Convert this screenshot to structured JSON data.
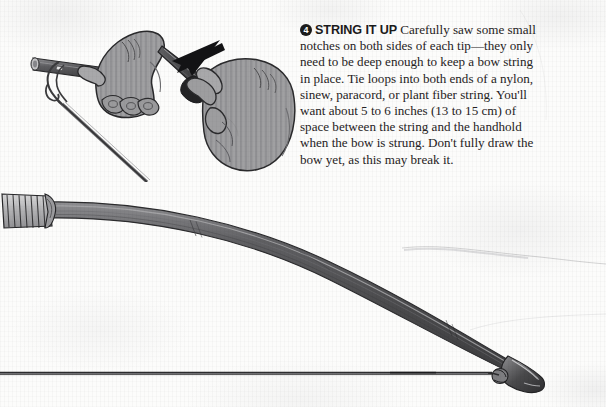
{
  "page": {
    "kind": "scanned-book-page",
    "width": 606,
    "height": 407,
    "background_color": "#fcfcfb"
  },
  "step": {
    "number": "4",
    "heading": "STRING IT UP",
    "body": "Carefully saw some small notches on both sides of each tip—they only need to be deep enough to keep a bow string in place. Tie loops into both ends of a nylon, sinew, paracord, or plant fiber string. You'll want about 5 to 6 inches (13 to 15 cm) of space between the string and the handhold when the bow is strung. Don't fully draw the bow yet, as this may break it."
  },
  "illustrations": {
    "top": {
      "name": "hands-tying-bowstring",
      "caption_elements": [
        "left-hand-holding-bow-tip",
        "right-hand-grasping-bow-tip",
        "string-loop-knot",
        "trailing-string",
        "pointer-arrow"
      ]
    },
    "bottom": {
      "name": "strung-bow-side-view",
      "caption_elements": [
        "wrapped-handhold-grip",
        "curved-bow-limb",
        "bow-tip-with-notch",
        "bowstring"
      ]
    }
  },
  "colors": {
    "paper": "#fcfcfb",
    "ink": "#231f20",
    "badge": "#1b1b1b",
    "limb_dark": "#4a4a4c",
    "limb_mid": "#5e5e60",
    "limb_light": "#8d8d90",
    "skin_fill": "#9c9c9e",
    "skin_shadow": "#7e7e80",
    "outline": "#2b2b2d",
    "string": "#3a3a3c"
  }
}
